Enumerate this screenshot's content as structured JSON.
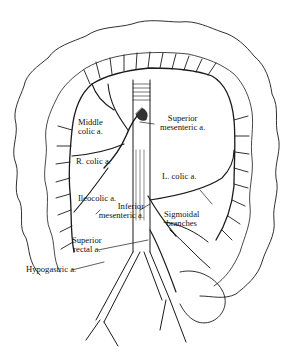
{
  "figure": {
    "labels": {
      "middle_colic": [
        "Middle",
        "colic a."
      ],
      "superior_mesenteric": [
        "Superior",
        "mesenteric a."
      ],
      "r_colic": "R. colic a.",
      "l_colic": "L. colic a.",
      "ileocolic": "Ileocolic a.",
      "inferior_mesenteric": [
        "Inferior",
        "mesenteric a."
      ],
      "sigmoidal_branches": [
        "Sigmoidal",
        "branches"
      ],
      "superior_rectal": [
        "Superior",
        "rectal a."
      ],
      "hypogastric": "Hypogastric a."
    },
    "colors": {
      "ink": "#1a1a1a",
      "background": "#ffffff"
    }
  }
}
